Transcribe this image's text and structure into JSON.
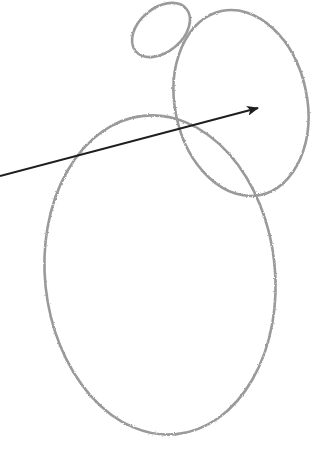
{
  "diagram": {
    "style": "pencil-sketch",
    "background": "#ffffff",
    "stroke_color": "#9a9a9a",
    "arrow_color": "#1e1e1e",
    "shapes": [
      {
        "name": "head-ellipse-small",
        "cx": 161,
        "cy": 30,
        "rx": 33,
        "ry": 22,
        "rotate": -40
      },
      {
        "name": "body-ellipse-upper",
        "cx": 241,
        "cy": 103,
        "rx": 66,
        "ry": 94,
        "rotate": -12
      },
      {
        "name": "body-ellipse-lower",
        "cx": 160,
        "cy": 275,
        "rx": 115,
        "ry": 160,
        "rotate": -6
      }
    ],
    "arrow": {
      "x1": 0,
      "y1": 176,
      "x2": 258,
      "y2": 108
    }
  }
}
